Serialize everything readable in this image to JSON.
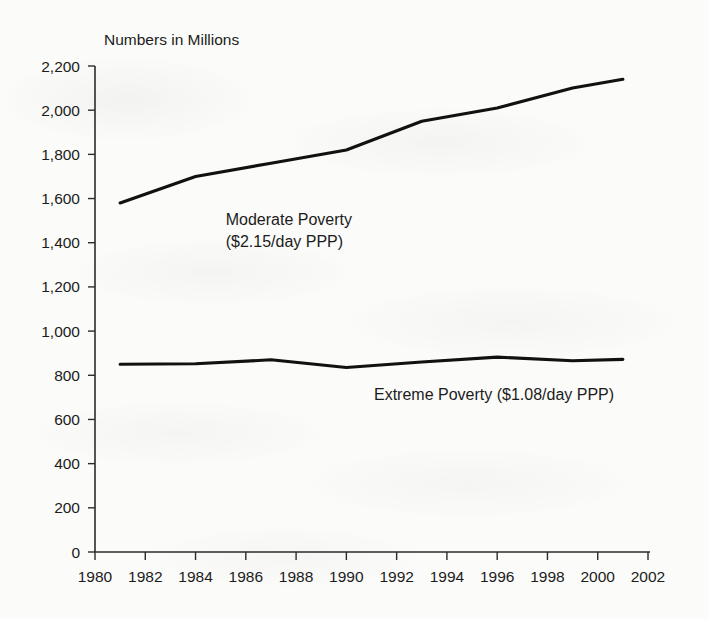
{
  "chart_data": {
    "type": "line",
    "title": "",
    "ylabel": "Numbers in Millions",
    "xlabel": "",
    "ylim": [
      0,
      2200
    ],
    "xlim": [
      1980,
      2002
    ],
    "grid": false,
    "legend_position": "inline-annotation",
    "y_ticks": [
      0,
      200,
      400,
      600,
      800,
      1000,
      1200,
      1400,
      1600,
      1800,
      2000,
      2200
    ],
    "y_tick_labels": [
      "0",
      "200",
      "400",
      "600",
      "800",
      "1,000",
      "1,200",
      "1,400",
      "1,600",
      "1,800",
      "2,000",
      "2,200"
    ],
    "x_ticks": [
      1980,
      1982,
      1984,
      1986,
      1988,
      1990,
      1992,
      1994,
      1996,
      1998,
      2000,
      2002
    ],
    "x_tick_labels": [
      "1980",
      "1982",
      "1984",
      "1986",
      "1988",
      "1990",
      "1992",
      "1994",
      "1996",
      "1998",
      "2000",
      "2002"
    ],
    "x": [
      1981,
      1984,
      1987,
      1990,
      1993,
      1996,
      1999,
      2001
    ],
    "series": [
      {
        "name": "Moderate Poverty ($2.15/day PPP)",
        "label_line1": "Moderate Poverty",
        "label_line2": "($2.15/day PPP)",
        "label_x": 1985.2,
        "label_y1": 1480,
        "label_y2": 1380,
        "color": "#111111",
        "values": [
          1580,
          1700,
          1760,
          1820,
          1950,
          2010,
          2100,
          2140
        ]
      },
      {
        "name": "Extreme Poverty ($1.08/day PPP)",
        "label_line1": "Extreme Poverty ($1.08/day PPP)",
        "label_line2": "",
        "label_x": 1991.1,
        "label_y1": 690,
        "label_y2": 0,
        "color": "#111111",
        "values": [
          850,
          852,
          870,
          835,
          860,
          882,
          866,
          872
        ]
      }
    ]
  },
  "axis": {
    "y_axis_title": "Numbers in Millions"
  }
}
